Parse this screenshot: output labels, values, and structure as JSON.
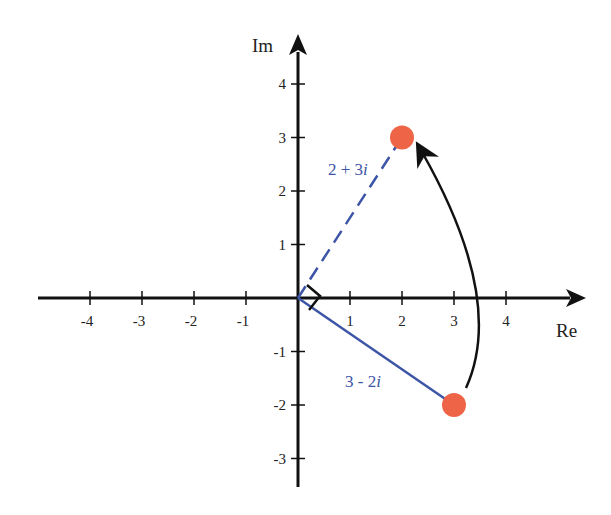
{
  "diagram": {
    "x_axis": {
      "label": "Re",
      "ticks": [
        -4,
        -3,
        -2,
        -1,
        1,
        2,
        3,
        4
      ],
      "range": [
        -5,
        5.3
      ]
    },
    "y_axis": {
      "label": "Im",
      "ticks": [
        4,
        3,
        2,
        1,
        -1,
        -2,
        -3
      ],
      "range": [
        -3.6,
        4.9
      ]
    },
    "points": [
      {
        "id": "p1",
        "re": 3,
        "im": -2,
        "label_main": "3 - 2",
        "label_i": "i",
        "line_style": "solid"
      },
      {
        "id": "p2",
        "re": 2,
        "im": 3,
        "label_main": "2 + 3",
        "label_i": "i",
        "line_style": "dashed"
      }
    ],
    "rotation_arrow": {
      "from": "p1",
      "to": "p2",
      "meaning": "rotation by 90 degrees"
    },
    "right_angle_marker": true,
    "colors": {
      "point": "#ee6446",
      "vector": "#3d55a6",
      "axis": "#111111"
    }
  }
}
